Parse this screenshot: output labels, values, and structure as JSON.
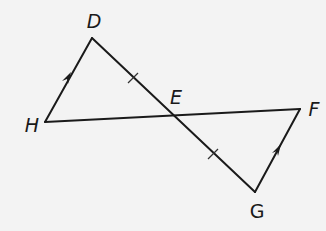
{
  "figure": {
    "type": "geometry",
    "points": [
      "D",
      "E",
      "F",
      "G",
      "H"
    ],
    "segments": [
      {
        "name": "HD",
        "from": "H",
        "to": "D",
        "marking": "parallel-arrow"
      },
      {
        "name": "DG",
        "from": "D",
        "to": "G",
        "marking": "passes through E"
      },
      {
        "name": "HF",
        "from": "H",
        "to": "F",
        "marking": "passes through E"
      },
      {
        "name": "GF",
        "from": "G",
        "to": "F",
        "marking": "parallel-arrow"
      }
    ],
    "congruence_marks": [
      {
        "segment": "DE",
        "ticks": 1
      },
      {
        "segment": "EG",
        "ticks": 1
      }
    ],
    "parallel_marks": [
      {
        "segment": "HD",
        "arrows": 1
      },
      {
        "segment": "GF",
        "arrows": 1
      }
    ],
    "labels": {
      "D": "D",
      "E": "E",
      "F": "F",
      "G": "G",
      "H": "H"
    },
    "colors": {
      "line": "#1a1a1a",
      "background": "#f3f3f3"
    }
  }
}
